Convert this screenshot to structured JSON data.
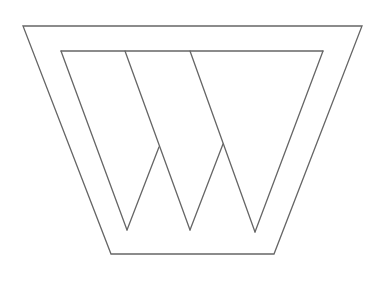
{
  "diagram": {
    "stroke_color": "#666666",
    "background": "#ffffff",
    "outer_trapezoid": [
      [
        23,
        26
      ],
      [
        362,
        26
      ],
      [
        274,
        254
      ],
      [
        111,
        254
      ]
    ],
    "inner_lines": [
      [
        [
          61,
          51
        ],
        [
          323,
          51
        ]
      ],
      [
        [
          61,
          51
        ],
        [
          127,
          230
        ]
      ],
      [
        [
          127,
          230
        ],
        [
          159,
          147
        ]
      ],
      [
        [
          125,
          51
        ],
        [
          190,
          230
        ]
      ],
      [
        [
          190,
          230
        ],
        [
          223,
          144
        ]
      ],
      [
        [
          190,
          51
        ],
        [
          255,
          232
        ]
      ],
      [
        [
          255,
          232
        ],
        [
          323,
          51
        ]
      ]
    ]
  }
}
